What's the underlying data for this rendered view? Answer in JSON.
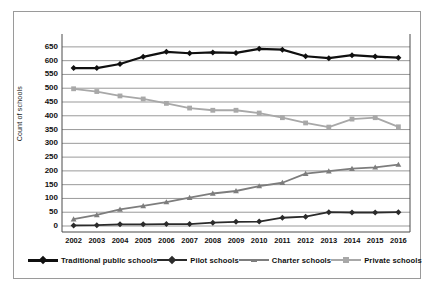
{
  "chart_data": {
    "type": "line",
    "title": "",
    "xlabel": "",
    "ylabel": "Count of schools",
    "categories": [
      "2002",
      "2003",
      "2004",
      "2005",
      "2006",
      "2007",
      "2008",
      "2009",
      "2010",
      "2011",
      "2012",
      "2013",
      "2014",
      "2015",
      "2016"
    ],
    "ylim": [
      0,
      675
    ],
    "yticks": [
      0,
      50,
      100,
      150,
      200,
      250,
      300,
      350,
      400,
      450,
      500,
      550,
      600,
      650
    ],
    "grid": "horizontal",
    "legend_position": "bottom",
    "series": [
      {
        "name": "Traditional public schools",
        "color": "#101010",
        "marker": "diamond",
        "values": [
          573,
          573,
          588,
          614,
          632,
          627,
          630,
          628,
          643,
          640,
          616,
          609,
          620,
          615,
          611
        ]
      },
      {
        "name": "Pilot schools",
        "color": "#2b2b2b",
        "marker": "diamond",
        "values": [
          2,
          3,
          6,
          6,
          7,
          7,
          12,
          15,
          16,
          30,
          34,
          50,
          49,
          49,
          50
        ]
      },
      {
        "name": "Charter schools",
        "color": "#7d7d7d",
        "marker": "triangle",
        "values": [
          25,
          40,
          60,
          73,
          87,
          103,
          118,
          127,
          145,
          157,
          190,
          199,
          208,
          213,
          223
        ]
      },
      {
        "name": "Private schools",
        "color": "#a8a8a8",
        "marker": "square",
        "values": [
          498,
          488,
          472,
          461,
          445,
          428,
          420,
          420,
          410,
          393,
          374,
          359,
          388,
          393,
          360
        ]
      }
    ]
  },
  "legend": {
    "items": [
      {
        "label": "Traditional public schools",
        "color": "#101010",
        "marker": "diamond"
      },
      {
        "label": "Pilot schools",
        "color": "#2b2b2b",
        "marker": "diamond"
      },
      {
        "label": "Charter schools",
        "color": "#7d7d7d",
        "marker": "triangle"
      },
      {
        "label": "Private schools",
        "color": "#a8a8a8",
        "marker": "square"
      }
    ]
  },
  "axes": {
    "y_title": "Count of schools"
  }
}
